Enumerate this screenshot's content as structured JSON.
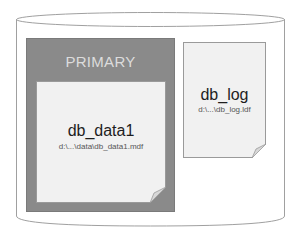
{
  "diagram": {
    "container": {
      "shape": "cylinder",
      "stroke": "#9a9a9a",
      "fill": "#ffffff"
    },
    "filegroup": {
      "label": "PRIMARY",
      "fill": "#8a8a8a",
      "label_color": "#dcdcdc"
    },
    "files": [
      {
        "name": "db_data1",
        "path": "d:\\...\\data\\db_data1.mdf",
        "group": "PRIMARY"
      },
      {
        "name": "db_log",
        "path": "d:\\...\\db_log.ldf",
        "group": null
      }
    ]
  }
}
